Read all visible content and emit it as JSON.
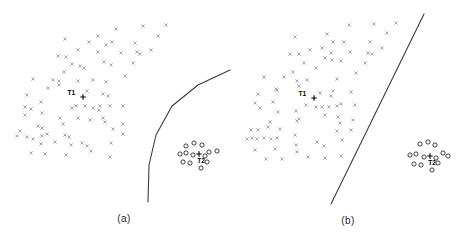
{
  "figure": {
    "background": "#ffffff",
    "x_marker_color": "#a9a9a9",
    "o_marker_color": "#2b2b2b",
    "boundary_color": "#3c3c3c",
    "annotation_color": "#000000",
    "caption_color": "#1f1f1f"
  },
  "chart_data": [
    {
      "type": "scatter",
      "panel": "a",
      "caption": "(a)",
      "title": "",
      "xlabel": "",
      "ylabel": "",
      "axes_shown": false,
      "legend": null,
      "series": [
        {
          "name": "class-x-cluster",
          "marker": "x",
          "color": "#a9a9a9",
          "points": [
            [
              65,
              39
            ],
            [
              89,
              42
            ],
            [
              98,
              36
            ],
            [
              78,
              50
            ],
            [
              58,
              56
            ],
            [
              66,
              57
            ],
            [
              98,
              52
            ],
            [
              72,
              64
            ],
            [
              80,
              66
            ],
            [
              84,
              68
            ],
            [
              64,
              72
            ],
            [
              33,
              79
            ],
            [
              53,
              80
            ],
            [
              59,
              81
            ],
            [
              78,
              81
            ],
            [
              93,
              80
            ],
            [
              116,
              29
            ],
            [
              143,
              26
            ],
            [
              166,
              25
            ],
            [
              112,
              42
            ],
            [
              106,
              45
            ],
            [
              135,
              43
            ],
            [
              158,
              36
            ],
            [
              121,
              53
            ],
            [
              137,
              52
            ],
            [
              140,
              54
            ],
            [
              151,
              50
            ],
            [
              104,
              62
            ],
            [
              111,
              65
            ],
            [
              133,
              63
            ],
            [
              125,
              76
            ],
            [
              106,
              82
            ],
            [
              48,
              88
            ],
            [
              59,
              85
            ],
            [
              27,
              95
            ],
            [
              41,
              102
            ],
            [
              87,
              91
            ],
            [
              25,
              107
            ],
            [
              31,
              109
            ],
            [
              42,
              113
            ],
            [
              72,
              108
            ],
            [
              76,
              106
            ],
            [
              85,
              106
            ],
            [
              93,
              108
            ],
            [
              99,
              110
            ],
            [
              25,
              115
            ],
            [
              60,
              118
            ],
            [
              78,
              118
            ],
            [
              90,
              120
            ],
            [
              38,
              126
            ],
            [
              42,
              128
            ],
            [
              63,
              124
            ],
            [
              20,
              131
            ],
            [
              17,
              136
            ],
            [
              27,
              137
            ],
            [
              33,
              139
            ],
            [
              42,
              136
            ],
            [
              47,
              134
            ],
            [
              65,
              135
            ],
            [
              69,
              137
            ],
            [
              41,
              144
            ],
            [
              55,
              142
            ],
            [
              71,
              145
            ],
            [
              82,
              143
            ],
            [
              87,
              146
            ],
            [
              31,
              153
            ],
            [
              45,
              154
            ],
            [
              66,
              155
            ],
            [
              91,
              151
            ],
            [
              103,
              94
            ],
            [
              108,
              96
            ],
            [
              100,
              106
            ],
            [
              110,
              106
            ],
            [
              123,
              106
            ],
            [
              105,
              122
            ],
            [
              103,
              118
            ],
            [
              123,
              124
            ],
            [
              113,
              129
            ],
            [
              123,
              134
            ],
            [
              111,
              143
            ],
            [
              110,
              157
            ]
          ]
        },
        {
          "name": "class-o-cluster",
          "marker": "o",
          "color": "#2b2b2b",
          "points": [
            [
              186,
              146
            ],
            [
              194,
              143
            ],
            [
              202,
              145
            ],
            [
              180,
              154
            ],
            [
              186,
              153
            ],
            [
              209,
              152
            ],
            [
              217,
              151
            ],
            [
              193,
              155
            ],
            [
              205,
              156
            ],
            [
              183,
              162
            ],
            [
              190,
              163
            ],
            [
              207,
              162
            ],
            [
              201,
              168
            ]
          ]
        }
      ],
      "annotations": [
        {
          "label": "T1",
          "marker": "plus",
          "x": 83,
          "y": 97,
          "label_x": 75,
          "label_y": 95,
          "label_anchor": "end"
        },
        {
          "label": "T2",
          "marker": "plus",
          "x": 199,
          "y": 154,
          "label_x": 201,
          "label_y": 163,
          "label_anchor": "middle"
        }
      ],
      "boundary": {
        "shape": "polyline",
        "points": [
          [
            230,
            70
          ],
          [
            198,
            85
          ],
          [
            172,
            106
          ],
          [
            156,
            135
          ],
          [
            149,
            165
          ],
          [
            148,
            202
          ]
        ]
      }
    },
    {
      "type": "scatter",
      "panel": "b",
      "caption": "(b)",
      "title": "",
      "xlabel": "",
      "ylabel": "",
      "axes_shown": false,
      "legend": null,
      "series": [
        {
          "name": "class-x-cluster",
          "marker": "x",
          "color": "#a9a9a9",
          "points": [
            [
              295,
              37
            ],
            [
              327,
              34
            ],
            [
              333,
              42
            ],
            [
              322,
              48
            ],
            [
              290,
              54
            ],
            [
              299,
              54
            ],
            [
              310,
              50
            ],
            [
              331,
              53
            ],
            [
              325,
              58
            ],
            [
              304,
              63
            ],
            [
              316,
              68
            ],
            [
              293,
              72
            ],
            [
              284,
              77
            ],
            [
              297,
              81
            ],
            [
              307,
              80
            ],
            [
              264,
              77
            ],
            [
              299,
              86
            ],
            [
              276,
              89
            ],
            [
              374,
              24
            ],
            [
              396,
              23
            ],
            [
              349,
              25
            ],
            [
              344,
              42
            ],
            [
              370,
              42
            ],
            [
              387,
              33
            ],
            [
              350,
              52
            ],
            [
              368,
              53
            ],
            [
              372,
              54
            ],
            [
              332,
              60
            ],
            [
              341,
              61
            ],
            [
              365,
              63
            ],
            [
              356,
              73
            ],
            [
              337,
              79
            ],
            [
              382,
              48
            ],
            [
              258,
              94
            ],
            [
              277,
              90
            ],
            [
              320,
              93
            ],
            [
              331,
              96
            ],
            [
              255,
              103
            ],
            [
              260,
              108
            ],
            [
              273,
              102
            ],
            [
              278,
              112
            ],
            [
              296,
              111
            ],
            [
              306,
              105
            ],
            [
              316,
              107
            ],
            [
              322,
              107
            ],
            [
              329,
              107
            ],
            [
              325,
              115
            ],
            [
              270,
              122
            ],
            [
              297,
              121
            ],
            [
              299,
              119
            ],
            [
              251,
              130
            ],
            [
              258,
              130
            ],
            [
              268,
              127
            ],
            [
              280,
              129
            ],
            [
              247,
              139
            ],
            [
              252,
              138
            ],
            [
              257,
              139
            ],
            [
              264,
              138
            ],
            [
              271,
              139
            ],
            [
              277,
              138
            ],
            [
              295,
              135
            ],
            [
              296,
              145
            ],
            [
              255,
              150
            ],
            [
              275,
              149
            ],
            [
              317,
              142
            ],
            [
              324,
              146
            ],
            [
              297,
              152
            ],
            [
              308,
              157
            ],
            [
              325,
              158
            ],
            [
              266,
              159
            ],
            [
              282,
              159
            ],
            [
              333,
              91
            ],
            [
              351,
              92
            ],
            [
              337,
              106
            ],
            [
              341,
              104
            ],
            [
              355,
              105
            ],
            [
              338,
              117
            ],
            [
              353,
              120
            ],
            [
              340,
              123
            ],
            [
              337,
              131
            ],
            [
              351,
              130
            ],
            [
              342,
              140
            ],
            [
              341,
              156
            ]
          ]
        },
        {
          "name": "class-o-cluster",
          "marker": "o",
          "color": "#2b2b2b",
          "points": [
            [
              420,
              144
            ],
            [
              428,
              142
            ],
            [
              435,
              145
            ],
            [
              410,
              155
            ],
            [
              416,
              154
            ],
            [
              443,
              153
            ],
            [
              448,
              156
            ],
            [
              424,
              157
            ],
            [
              436,
              158
            ],
            [
              414,
              164
            ],
            [
              421,
              165
            ],
            [
              438,
              163
            ],
            [
              432,
              170
            ]
          ]
        }
      ],
      "annotations": [
        {
          "label": "T1",
          "marker": "plus",
          "x": 314,
          "y": 98,
          "label_x": 306,
          "label_y": 96,
          "label_anchor": "end"
        },
        {
          "label": "T2",
          "marker": "plus",
          "x": 430,
          "y": 156,
          "label_x": 432,
          "label_y": 165,
          "label_anchor": "middle"
        }
      ],
      "boundary": {
        "shape": "polyline",
        "points": [
          [
            424,
            14
          ],
          [
            331,
            204
          ]
        ]
      }
    }
  ]
}
